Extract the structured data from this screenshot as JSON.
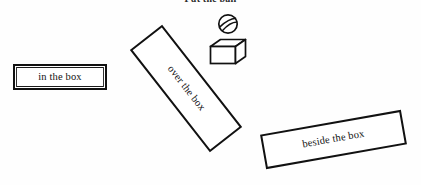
{
  "page": {
    "title": "Put the ball",
    "background_color": "#ffffff",
    "ink_color": "#111111",
    "width": 421,
    "height": 185
  },
  "instruction": {
    "label": "Put the ball",
    "clipped_at_top": true
  },
  "options": [
    {
      "id": "in",
      "label": "in the box",
      "preposition": "in",
      "rotation_deg": 0,
      "border_style": "double"
    },
    {
      "id": "over",
      "label": "over the box",
      "preposition": "over",
      "rotation_deg": 52,
      "border_style": "single"
    },
    {
      "id": "beside",
      "label": "beside the box",
      "preposition": "beside",
      "rotation_deg": -10,
      "border_style": "single"
    }
  ],
  "objects": [
    {
      "id": "ball",
      "name": "ball",
      "icon": "striped-ball-icon",
      "description": "circle with two curved stripes"
    },
    {
      "id": "box",
      "name": "box",
      "icon": "open-cube-icon",
      "description": "open rectangular box in 3D perspective"
    }
  ]
}
